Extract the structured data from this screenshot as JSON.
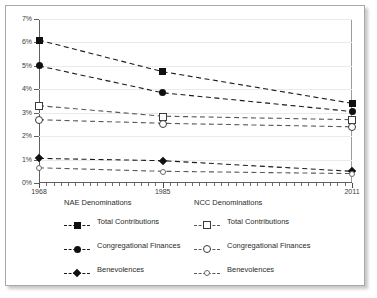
{
  "chart_data": {
    "type": "line",
    "title": "",
    "xlabel": "",
    "ylabel": "",
    "x": [
      1968,
      1985,
      2011
    ],
    "xtick_labels": [
      "1968",
      "1985",
      "2011"
    ],
    "xlim": [
      1968,
      2011
    ],
    "ylim": [
      0,
      7
    ],
    "ytick_labels": [
      "0%",
      "1%",
      "2%",
      "3%",
      "4%",
      "5%",
      "6%",
      "7%"
    ],
    "ytick_values": [
      0,
      1,
      2,
      3,
      4,
      5,
      6,
      7
    ],
    "grid": true,
    "legend_position": "below",
    "series": [
      {
        "name": "Total Contributions",
        "group": "NAE Denominations",
        "marker": "filled-square",
        "values": [
          6.1,
          4.75,
          3.4
        ]
      },
      {
        "name": "Congregational Finances",
        "group": "NAE Denominations",
        "marker": "filled-circle",
        "values": [
          5.0,
          3.85,
          3.05
        ]
      },
      {
        "name": "Benevolences",
        "group": "NAE Denominations",
        "marker": "filled-diamond",
        "values": [
          1.05,
          0.95,
          0.5
        ]
      },
      {
        "name": "Total Contributions",
        "group": "NCC Denominations",
        "marker": "open-square",
        "values": [
          3.3,
          2.85,
          2.7
        ]
      },
      {
        "name": "Congregational Finances",
        "group": "NCC Denominations",
        "marker": "open-circle",
        "values": [
          2.7,
          2.55,
          2.4
        ]
      },
      {
        "name": "Benevolences",
        "group": "NCC Denominations",
        "marker": "open-circle-small",
        "values": [
          0.65,
          0.5,
          0.4
        ]
      }
    ]
  },
  "legend": {
    "nae": {
      "title": "NAE Denominations",
      "items": [
        {
          "label": "Total Contributions"
        },
        {
          "label": "Congregational Finances"
        },
        {
          "label": "Benevolences"
        }
      ]
    },
    "ncc": {
      "title": "NCC Denominations",
      "items": [
        {
          "label": "Total Contributions"
        },
        {
          "label": "Congregational Finances"
        },
        {
          "label": "Benevolences"
        }
      ]
    }
  },
  "colors": {
    "line": "#1b1b1b",
    "line_light": "#5a5a5a",
    "grid": "#eceaea",
    "axis": "#606060",
    "text": "#2b2b2b"
  }
}
